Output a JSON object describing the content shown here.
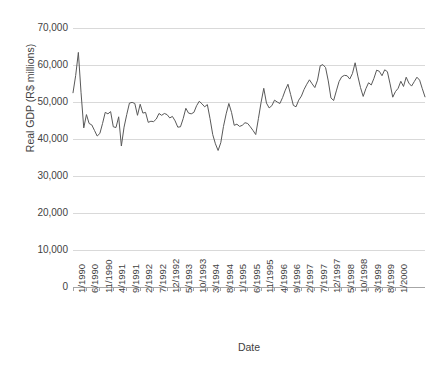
{
  "chart_data": {
    "type": "line",
    "title": "",
    "xlabel": "Date",
    "ylabel": "Real GDP (R$ millions)",
    "ylim": [
      0,
      70000
    ],
    "y_ticks": [
      0,
      10000,
      20000,
      30000,
      40000,
      50000,
      60000,
      70000
    ],
    "y_tick_labels": [
      "0",
      "10,000",
      "20,000",
      "30,000",
      "40,000",
      "50,000",
      "60,000",
      "70,000"
    ],
    "grid": "horizontal",
    "legend": "none",
    "line_color": "#595959",
    "gridline_color": "#d9d9d9",
    "axis_color": "#a6a6a6",
    "x_tick_labels": [
      "1/1990",
      "6/1990",
      "11/1990",
      "4/1991",
      "9/1991",
      "2/1992",
      "7/1992",
      "12/1992",
      "5/1993",
      "10/1993",
      "3/1994",
      "8/1994",
      "1/1995",
      "6/1995",
      "11/1995",
      "4/1996",
      "9/1996",
      "2/1997",
      "7/1997",
      "12/1997",
      "5/1998",
      "10/1998",
      "3/1999",
      "8/1999",
      "1/2000"
    ],
    "x_tick_interval_months": 5,
    "x_start": "1/1990",
    "x_end": "1/2000",
    "series": [
      {
        "name": "Real GDP",
        "values": [
          52500,
          57200,
          63400,
          52500,
          43000,
          46600,
          44200,
          43800,
          42300,
          40800,
          41500,
          44200,
          47200,
          46800,
          47400,
          43300,
          43100,
          46000,
          38100,
          43200,
          46600,
          49700,
          49900,
          49600,
          46400,
          49400,
          47000,
          47200,
          44500,
          44800,
          44700,
          45400,
          46900,
          46400,
          46900,
          46600,
          45700,
          46100,
          44900,
          43200,
          43300,
          45500,
          48300,
          47000,
          46800,
          47200,
          49000,
          50200,
          49500,
          48700,
          49300,
          45500,
          41200,
          38700,
          36900,
          39000,
          43400,
          46800,
          49600,
          47200,
          43700,
          44000,
          43400,
          43700,
          44400,
          44200,
          43300,
          42300,
          41200,
          45500,
          49900,
          53700,
          49700,
          48400,
          49000,
          50500,
          50000,
          49600,
          51200,
          53200,
          54800,
          52000,
          49100,
          48700,
          50500,
          51600,
          53400,
          54800,
          56000,
          54900,
          53900,
          55900,
          59800,
          60100,
          59300,
          55700,
          51100,
          50400,
          53000,
          55500,
          56800,
          57200,
          57100,
          56200,
          57700,
          60600,
          57000,
          53900,
          51500,
          53600,
          55200,
          54600,
          56400,
          58600,
          58300,
          57100,
          58700,
          58200,
          54900,
          51300,
          52800,
          53700,
          55600,
          54200,
          56700,
          55100,
          54300,
          55500,
          56700,
          55900,
          53600,
          51400
        ]
      }
    ]
  }
}
